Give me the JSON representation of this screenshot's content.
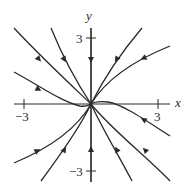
{
  "diagram": {
    "type": "phase-portrait",
    "axes": {
      "x_label": "x",
      "y_label": "y",
      "x_ticks": [
        {
          "value": -3,
          "label": "−3"
        },
        {
          "value": 3,
          "label": "3"
        }
      ],
      "y_ticks": [
        {
          "value": 3,
          "label": "3"
        },
        {
          "value": -3,
          "label": "−3"
        }
      ]
    },
    "labels": {
      "x": "x",
      "y": "y",
      "x_neg3": "−3",
      "x_pos3": "3",
      "y_pos3": "3",
      "y_neg3": "−3"
    },
    "equilibrium": {
      "x": 0,
      "y": 0,
      "type": "node (stable, all trajectories approach origin)"
    },
    "trajectory_count": 12,
    "colors": {
      "ink": "#2a2a2a",
      "background": "#ffffff"
    }
  }
}
